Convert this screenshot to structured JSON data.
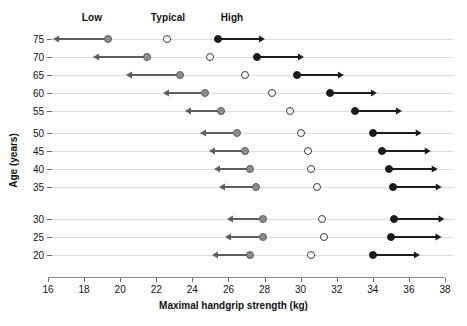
{
  "chart_data": {
    "type": "scatter",
    "title": "",
    "xlabel": "Maximal handgrip strength (kg)",
    "ylabel": "Age (years)",
    "xlim": [
      16,
      38
    ],
    "ylim": [
      17.5,
      77.5
    ],
    "xticks": [
      16,
      18,
      20,
      22,
      24,
      26,
      28,
      30,
      32,
      34,
      36,
      38
    ],
    "yticks": [
      75,
      70,
      65,
      60,
      55,
      50,
      45,
      40,
      35,
      30,
      25,
      20
    ],
    "grid": "horizontal-row-lines",
    "legend_position": "top",
    "legend": [
      {
        "name": "Low",
        "marker": "filled-gray-circle",
        "color": "#8c8c8c",
        "arrow": "left"
      },
      {
        "name": "Typical",
        "marker": "open-circle",
        "color": "#ffffff",
        "arrow": "none"
      },
      {
        "name": "High",
        "marker": "filled-black-circle",
        "color": "#1c1c1c",
        "arrow": "right"
      }
    ],
    "categories": [
      75,
      70,
      65,
      60,
      55,
      50,
      45,
      40,
      35,
      30,
      25,
      20
    ],
    "series": [
      {
        "name": "Low",
        "values": [
          19.3,
          21.5,
          23.3,
          24.7,
          25.6,
          26.5,
          26.9,
          27.2,
          27.5,
          27.9,
          27.9,
          27.2
        ]
      },
      {
        "name": "Typical",
        "values": [
          22.6,
          25.0,
          26.9,
          28.4,
          29.4,
          30.0,
          30.4,
          30.6,
          30.9,
          31.2,
          31.3,
          30.6
        ]
      },
      {
        "name": "High",
        "values": [
          25.4,
          27.6,
          29.8,
          31.6,
          33.0,
          34.0,
          34.5,
          34.9,
          35.1,
          35.2,
          35.0,
          34.0
        ]
      }
    ],
    "low_arrow_lengths": [
      3.0,
      3.0,
      3.0,
      2.3,
      2.0,
      2.1,
      2.0,
      2.0,
      2.0,
      2.0,
      2.1,
      2.1
    ],
    "high_arrow_lengths": [
      2.6,
      2.6,
      2.6,
      2.6,
      2.6,
      2.7,
      2.7,
      2.7,
      2.7,
      2.8,
      2.8,
      2.6
    ]
  },
  "axis": {
    "x_title": "Maximal handgrip strength (kg)",
    "y_title": "Age (years)",
    "x_tick_labels": [
      "16",
      "18",
      "20",
      "22",
      "24",
      "26",
      "28",
      "30",
      "32",
      "34",
      "36",
      "38"
    ],
    "y_tick_labels": [
      "75",
      "70",
      "65",
      "60",
      "55",
      "50",
      "45",
      "40",
      "35",
      "30",
      "25",
      "20"
    ]
  },
  "legend": {
    "low_label": "Low",
    "typical_label": "Typical",
    "high_label": "High"
  },
  "colors": {
    "low": "#8c8c8c",
    "typical": "#ffffff",
    "high": "#1c1c1c",
    "axis": "#8a8a8a",
    "row_line": "#dcdcdc",
    "text": "#111111"
  }
}
